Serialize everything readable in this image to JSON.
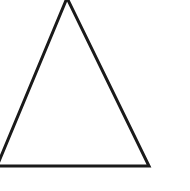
{
  "canvas": {
    "width": 190,
    "height": 191,
    "background_color": "#ffffff",
    "title": "Triangle Outline"
  },
  "figure": {
    "name": "triangle",
    "shape_type": "triangle",
    "fill_color": "#ffffff",
    "stroke_color": "#1a1a1a",
    "stroke_width": 3,
    "clipped_edges": [
      "top",
      "left"
    ],
    "vertices": [
      {
        "label": "apex",
        "x": 67,
        "y": -2
      },
      {
        "label": "bottom-right",
        "x": 149,
        "y": 166
      },
      {
        "label": "bottom-left",
        "x": -3,
        "y": 166
      }
    ],
    "points_attr": "67,-2 149,166 -3,166"
  }
}
